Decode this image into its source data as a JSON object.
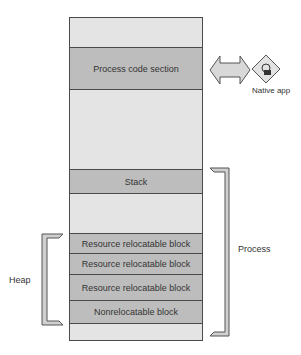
{
  "memory_map": {
    "sections": [
      {
        "id": "top-free",
        "label": "",
        "shade": "light"
      },
      {
        "id": "process-code-section",
        "label": "Process code section",
        "shade": "dark"
      },
      {
        "id": "free-above-stack",
        "label": "",
        "shade": "light"
      },
      {
        "id": "stack",
        "label": "Stack",
        "shade": "dark"
      },
      {
        "id": "free-below-stack",
        "label": "",
        "shade": "light"
      },
      {
        "id": "resource-relocatable-block-1",
        "label": "Resource relocatable block",
        "shade": "dark"
      },
      {
        "id": "resource-relocatable-block-2",
        "label": "Resource relocatable block",
        "shade": "dark"
      },
      {
        "id": "resource-relocatable-block-3",
        "label": "Resource relocatable block",
        "shade": "dark"
      },
      {
        "id": "nonrelocatable-block",
        "label": "Nonrelocatable block",
        "shade": "dark"
      },
      {
        "id": "bottom-free",
        "label": "",
        "shade": "light"
      }
    ]
  },
  "labels": {
    "native_app": "Native app",
    "process": "Process",
    "heap": "Heap"
  },
  "colors": {
    "dark_block": "#bdbdbd",
    "light_block": "#e4e4e4",
    "outline": "#4a4a4a"
  }
}
